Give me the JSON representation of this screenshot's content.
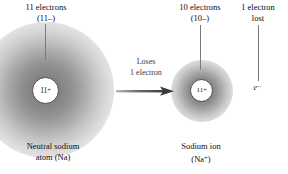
{
  "figure": {
    "background_color": "#ffffff"
  },
  "labels": {
    "top_left_line1": "11 electrons",
    "top_left_line2": "(11–)",
    "top_mid_line1": "10 electrons",
    "top_mid_line2": "(10–)",
    "top_right_line1": "1 electron",
    "top_right_line2": "lost",
    "arrow_line1": "Loses",
    "arrow_line2": "1 electron",
    "bottom_left_line1": "Neutral sodium",
    "bottom_left_line2": "atom (Na)",
    "bottom_mid_line1": "Sodium ion",
    "bottom_mid_line2_base": "(Na",
    "bottom_mid_line2_sup": "+",
    "bottom_mid_line2_close": ")"
  },
  "nuclei": {
    "left_charge_base": "11",
    "left_charge_sup": "+",
    "right_charge_base": "11",
    "right_charge_sup": "+"
  },
  "electron": {
    "symbol_base": "e",
    "symbol_sup": "–"
  },
  "colors": {
    "cloud_core": "#7d7d7d",
    "nucleus_fill": "#ffffff",
    "nucleus_stroke": "#4a4a4a",
    "arrow": "#3f3f3f",
    "leader_line": "#7a7a7a",
    "text": "#0d0d0d"
  }
}
